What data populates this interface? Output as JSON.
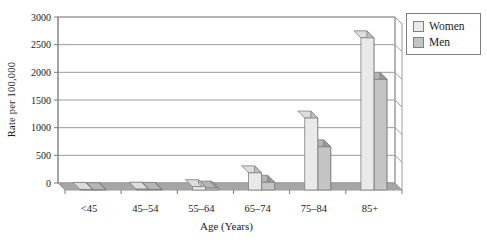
{
  "chart_data": {
    "type": "bar",
    "style": "3d-effect-grayscale-clustered-columns",
    "title": "",
    "categories": [
      "<45",
      "45–54",
      "55–64",
      "65–74",
      "75–84",
      "85+"
    ],
    "series": [
      {
        "name": "Women",
        "values": [
          10,
          15,
          60,
          310,
          1300,
          2750
        ],
        "color_front": "#e9e9e9",
        "color_side": "#bfbfbf",
        "color_top": "#dcdcdc"
      },
      {
        "name": "Men",
        "values": [
          5,
          10,
          35,
          140,
          780,
          2000
        ],
        "color_front": "#c4c4c4",
        "color_side": "#989898",
        "color_top": "#b5b5b5"
      }
    ],
    "xlabel": "Age (Years)",
    "ylabel": "Rate per 100,000",
    "ylim": [
      0,
      3000
    ],
    "ytick_step": 500,
    "yticks": [
      "0",
      "500",
      "1000",
      "1500",
      "2000",
      "2500",
      "3000"
    ],
    "grid": true,
    "legend_position": "top-right",
    "colors": {
      "floor": "#a6a6a6",
      "gridline": "#9c9c9c",
      "axis": "#7a7a7a",
      "bar_outline": "#7f7f7f",
      "wall": "#ffffff",
      "text": "#1a1a1a"
    }
  }
}
